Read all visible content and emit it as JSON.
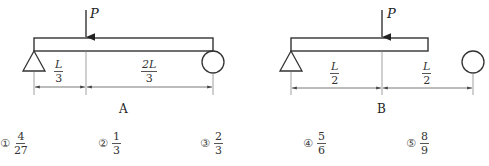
{
  "diagrams": [
    {
      "id": "A",
      "caption": "A",
      "load_label": "P",
      "segments": [
        {
          "num": "L",
          "den": "3"
        },
        {
          "num": "2L",
          "den": "3"
        }
      ],
      "left_support": "pin",
      "right_support": "roller"
    },
    {
      "id": "B",
      "caption": "B",
      "load_label": "P",
      "segments": [
        {
          "num": "L",
          "den": "2"
        },
        {
          "num": "L",
          "den": "2"
        }
      ],
      "left_support": "pin",
      "right_support": "roller"
    }
  ],
  "choices": [
    {
      "mark": "①",
      "num": "4",
      "den": "27"
    },
    {
      "mark": "②",
      "num": "1",
      "den": "3"
    },
    {
      "mark": "③",
      "num": "2",
      "den": "3"
    },
    {
      "mark": "④",
      "num": "5",
      "den": "6"
    },
    {
      "mark": "⑤",
      "num": "8",
      "den": "9"
    }
  ],
  "colors": {
    "line": "#333333",
    "thin": "#777777",
    "background": "#ffffff"
  }
}
